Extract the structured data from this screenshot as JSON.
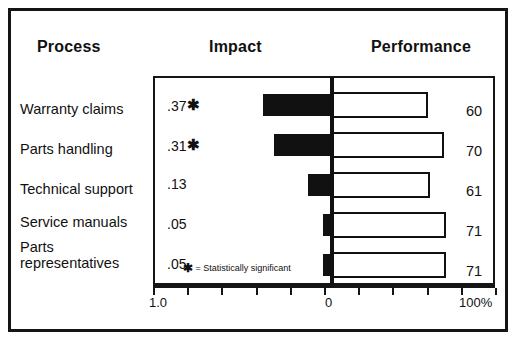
{
  "headers": {
    "process": "Process",
    "impact": "Impact",
    "performance": "Performance"
  },
  "footnote": {
    "star": "✱",
    "text": "= Statistically significant"
  },
  "axis": {
    "left_label": "1.0",
    "zero_label": "0",
    "right_label": "100%"
  },
  "chart_data": {
    "type": "bar",
    "title": "",
    "subtitle": "",
    "orientation": "horizontal",
    "layout": "diverging bidirectional bar chart; Impact bars (solid black) extend left from the zero axis, Performance bars (white with black outline) extend right from the zero axis",
    "categories": [
      "Warranty claims",
      "Parts handling",
      "Technical support",
      "Service manuals",
      "Parts representatives"
    ],
    "series": [
      {
        "name": "Impact",
        "direction": "left",
        "style": "solid black fill",
        "axis_label": "Impact",
        "axis_range": [
          1.0,
          0
        ],
        "values": [
          0.37,
          0.31,
          0.13,
          0.05,
          0.05
        ],
        "display_values": [
          ".37",
          ".31",
          ".13",
          ".05",
          ".05"
        ],
        "significant": [
          true,
          true,
          false,
          false,
          false
        ]
      },
      {
        "name": "Performance",
        "direction": "right",
        "style": "white fill with black outline",
        "axis_label": "Performance",
        "axis_range": [
          0,
          100
        ],
        "axis_units": "%",
        "values": [
          60,
          70,
          61,
          71,
          71
        ],
        "display_values": [
          "60",
          "70",
          "61",
          "71",
          "71"
        ]
      }
    ],
    "xlabel": "",
    "ylabel": "",
    "xlim_left": [
      1.0,
      0
    ],
    "xlim_right": [
      0,
      100
    ],
    "grid": false,
    "legend": "none",
    "tick_count": 10,
    "annotations": [
      "✱ = Statistically significant"
    ]
  },
  "rows": [
    {
      "process": "Warranty claims",
      "impact": ".37",
      "significant": true,
      "impact_fraction": 0.37,
      "performance": "60",
      "performance_fraction": 0.6
    },
    {
      "process": "Parts handling",
      "impact": ".31",
      "significant": true,
      "impact_fraction": 0.31,
      "performance": "70",
      "performance_fraction": 0.7
    },
    {
      "process": "Technical support",
      "impact": ".13",
      "significant": false,
      "impact_fraction": 0.13,
      "performance": "61",
      "performance_fraction": 0.61
    },
    {
      "process": "Service manuals",
      "impact": ".05",
      "significant": false,
      "impact_fraction": 0.05,
      "performance": "71",
      "performance_fraction": 0.71
    },
    {
      "process": "Parts\nrepresentatives",
      "impact": ".05",
      "significant": false,
      "impact_fraction": 0.05,
      "performance": "71",
      "performance_fraction": 0.71
    }
  ],
  "colors": {
    "ink": "#111111",
    "frame": "#151515",
    "impact_bar": "#111111",
    "performance_bar_fill": "#ffffff",
    "performance_bar_stroke": "#111111",
    "background": "#ffffff"
  }
}
